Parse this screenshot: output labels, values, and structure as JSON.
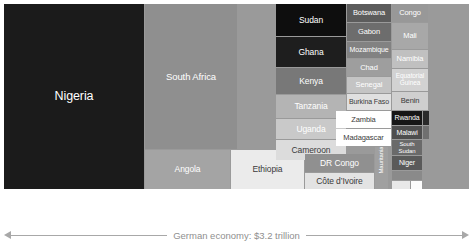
{
  "chart_data": {
    "type": "treemap",
    "title": "",
    "annotations": [
      "Total sub-Saharan economy: $2.7 trillion",
      "German economy: $3.2 trillion"
    ],
    "categories": [
      "Nigeria",
      "South Africa",
      "Angola",
      "Ethiopia",
      "Sudan",
      "Ghana",
      "Kenya",
      "Tanzania",
      "Uganda",
      "Cameroon",
      "DR Congo",
      "Côte d’Ivoire",
      "Botswana",
      "Gabon",
      "Mozambique",
      "Chad",
      "Senegal",
      "Burkina Faso",
      "Zambia",
      "Madagascar",
      "Mauritania",
      "Congo",
      "Mali",
      "Namibia",
      "Equatorial Guinea",
      "Benin",
      "Rwanda",
      "Malawi",
      "South Sudan",
      "Niger"
    ],
    "total_label": "Total sub-Saharan economy: $2.7 trillion",
    "comparison_label": "German economy: $3.2 trillion",
    "total_value": 2.7,
    "comparison_value": 3.2,
    "units": "trillion USD"
  },
  "treemap": {
    "background": "#9a9a9a",
    "tiles": [
      {
        "name": "Nigeria",
        "label": "Nigeria",
        "x": 0,
        "y": 0,
        "w": 140,
        "h": 185,
        "fill": "#1b1b1b",
        "color": "#ffffff",
        "size": 12.5,
        "vertical": false
      },
      {
        "name": "South Africa",
        "label": "South Africa",
        "x": 141,
        "y": 0,
        "w": 92,
        "h": 145,
        "fill": "#8f8f8f",
        "color": "#ffffff",
        "size": 9.5,
        "vertical": false
      },
      {
        "name": "Angola",
        "label": "Angola",
        "x": 141,
        "y": 146,
        "w": 85,
        "h": 39,
        "fill": "#a4a4a4",
        "color": "#ffffff",
        "size": 8.5,
        "vertical": false
      },
      {
        "name": "Ethiopia",
        "label": "Ethiopia",
        "x": 227,
        "y": 146,
        "w": 73,
        "h": 39,
        "fill": "#ebebeb",
        "color": "#3a3a3a",
        "size": 8.5,
        "vertical": false
      },
      {
        "name": "Sudan",
        "label": "Sudan",
        "x": 272,
        "y": 0,
        "w": 70,
        "h": 32,
        "fill": "#0e0e0e",
        "color": "#ffffff",
        "size": 8.5,
        "vertical": false
      },
      {
        "name": "Ghana",
        "label": "Ghana",
        "x": 272,
        "y": 33,
        "w": 70,
        "h": 30,
        "fill": "#1e1e1e",
        "color": "#ffffff",
        "size": 8.5,
        "vertical": false
      },
      {
        "name": "Kenya",
        "label": "Kenya",
        "x": 272,
        "y": 64,
        "w": 70,
        "h": 26,
        "fill": "#787878",
        "color": "#ffffff",
        "size": 8.5,
        "vertical": false
      },
      {
        "name": "Tanzania",
        "label": "Tanzania",
        "x": 272,
        "y": 91,
        "w": 70,
        "h": 23,
        "fill": "#b4b4b4",
        "color": "#ffffff",
        "size": 8.5,
        "vertical": false
      },
      {
        "name": "Uganda",
        "label": "Uganda",
        "x": 272,
        "y": 115,
        "w": 70,
        "h": 20,
        "fill": "#c9c9c9",
        "color": "#ffffff",
        "size": 8.5,
        "vertical": false
      },
      {
        "name": "Cameroon",
        "label": "Cameroon",
        "x": 272,
        "y": 136,
        "w": 70,
        "h": 20,
        "fill": "#dcdcdc",
        "color": "#3a3a3a",
        "size": 8.5,
        "vertical": false
      },
      {
        "name": "DR Congo",
        "label": "DR Congo",
        "x": 301,
        "y": 150,
        "w": 69,
        "h": 18,
        "fill": "#909090",
        "color": "#ffffff",
        "size": 8.5,
        "vertical": false
      },
      {
        "name": "Cote dIvoire",
        "label": "Côte d’Ivoire",
        "x": 301,
        "y": 169,
        "w": 69,
        "h": 16,
        "fill": "#e3e3e3",
        "color": "#3a3a3a",
        "size": 8.5,
        "vertical": false
      },
      {
        "name": "Botswana",
        "label": "Botswana",
        "x": 343,
        "y": 0,
        "w": 44,
        "h": 18,
        "fill": "#5c5c5c",
        "color": "#ffffff",
        "size": 7.5,
        "vertical": false
      },
      {
        "name": "Gabon",
        "label": "Gabon",
        "x": 343,
        "y": 19,
        "w": 44,
        "h": 18,
        "fill": "#6d6d6d",
        "color": "#ffffff",
        "size": 7.5,
        "vertical": false
      },
      {
        "name": "Mozambique",
        "label": "Mozambique",
        "x": 343,
        "y": 38,
        "w": 44,
        "h": 16,
        "fill": "#828282",
        "color": "#ffffff",
        "size": 7,
        "vertical": false
      },
      {
        "name": "Chad",
        "label": "Chad",
        "x": 343,
        "y": 55,
        "w": 44,
        "h": 17,
        "fill": "#9e9e9e",
        "color": "#ffffff",
        "size": 7.5,
        "vertical": false
      },
      {
        "name": "Senegal",
        "label": "Senegal",
        "x": 343,
        "y": 73,
        "w": 44,
        "h": 16,
        "fill": "#c4c4c4",
        "color": "#ffffff",
        "size": 7.5,
        "vertical": false
      },
      {
        "name": "Burkina Faso",
        "label": "Burkina Faso",
        "x": 343,
        "y": 90,
        "w": 44,
        "h": 16,
        "fill": "#e0e0e0",
        "color": "#3a3a3a",
        "size": 7,
        "vertical": false
      },
      {
        "name": "Zambia",
        "label": "Zambia",
        "x": 332,
        "y": 107,
        "w": 55,
        "h": 17,
        "fill": "#ffffff",
        "color": "#3a3a3a",
        "size": 7.5,
        "vertical": false
      },
      {
        "name": "Madagascar",
        "label": "Madagascar",
        "x": 332,
        "y": 125,
        "w": 55,
        "h": 17,
        "fill": "#ffffff",
        "color": "#3a3a3a",
        "size": 7.5,
        "vertical": false
      },
      {
        "name": "Mauritania",
        "label": "Mauritania",
        "x": 371,
        "y": 143,
        "w": 13,
        "h": 42,
        "fill": "#a0a0a0",
        "color": "#ffffff",
        "size": 6,
        "vertical": true
      },
      {
        "name": "Congo",
        "label": "Congo",
        "x": 388,
        "y": 0,
        "w": 36,
        "h": 18,
        "fill": "#989898",
        "color": "#ffffff",
        "size": 7.5,
        "vertical": false
      },
      {
        "name": "Mali",
        "label": "Mali",
        "x": 388,
        "y": 19,
        "w": 36,
        "h": 26,
        "fill": "#a8a8a8",
        "color": "#ffffff",
        "size": 7.5,
        "vertical": false
      },
      {
        "name": "Namibia",
        "label": "Namibia",
        "x": 388,
        "y": 46,
        "w": 36,
        "h": 18,
        "fill": "#c0c0c0",
        "color": "#ffffff",
        "size": 7.5,
        "vertical": false
      },
      {
        "name": "Equatorial Guinea",
        "label": "Equatorial Guinea",
        "x": 388,
        "y": 65,
        "w": 36,
        "h": 22,
        "fill": "#d2d2d2",
        "color": "#ffffff",
        "size": 6.5,
        "vertical": false
      },
      {
        "name": "Benin",
        "label": "Benin",
        "x": 388,
        "y": 88,
        "w": 36,
        "h": 18,
        "fill": "#cfcfcf",
        "color": "#3a3a3a",
        "size": 7.5,
        "vertical": false
      },
      {
        "name": "Rwanda",
        "label": "Rwanda",
        "x": 388,
        "y": 107,
        "w": 30,
        "h": 14,
        "fill": "#161616",
        "color": "#ffffff",
        "size": 7,
        "vertical": false
      },
      {
        "name": "Malawi",
        "label": "Malawi",
        "x": 388,
        "y": 122,
        "w": 30,
        "h": 13,
        "fill": "#4e4e4e",
        "color": "#ffffff",
        "size": 7,
        "vertical": false
      },
      {
        "name": "South Sudan",
        "label": "South Sudan",
        "x": 388,
        "y": 136,
        "w": 30,
        "h": 15,
        "fill": "#6a6a6a",
        "color": "#ffffff",
        "size": 6,
        "vertical": false
      },
      {
        "name": "Niger",
        "label": "Niger",
        "x": 388,
        "y": 152,
        "w": 30,
        "h": 14,
        "fill": "#5a5a5a",
        "color": "#ffffff",
        "size": 7,
        "vertical": false
      },
      {
        "name": "unlabeled-a",
        "label": "",
        "x": 419,
        "y": 107,
        "w": 6,
        "h": 14,
        "fill": "#2a2a2a",
        "color": "#ffffff",
        "size": 5,
        "vertical": false
      },
      {
        "name": "unlabeled-b",
        "label": "",
        "x": 419,
        "y": 122,
        "w": 6,
        "h": 13,
        "fill": "#707070",
        "color": "#ffffff",
        "size": 5,
        "vertical": false
      },
      {
        "name": "unlabeled-c",
        "label": "",
        "x": 388,
        "y": 167,
        "w": 30,
        "h": 9,
        "fill": "#8a8a8a",
        "color": "#ffffff",
        "size": 5,
        "vertical": false
      },
      {
        "name": "unlabeled-d",
        "label": "",
        "x": 388,
        "y": 177,
        "w": 18,
        "h": 8,
        "fill": "#e8e8e8",
        "color": "#3a3a3a",
        "size": 5,
        "vertical": false
      },
      {
        "name": "unlabeled-e",
        "label": "",
        "x": 407,
        "y": 177,
        "w": 11,
        "h": 8,
        "fill": "#fcfcfc",
        "color": "#3a3a3a",
        "size": 5,
        "vertical": false
      }
    ]
  },
  "captions": {
    "subsaharan": "Total sub-Saharan economy: $2.7 trillion",
    "german": "German economy: $3.2 trillion"
  }
}
